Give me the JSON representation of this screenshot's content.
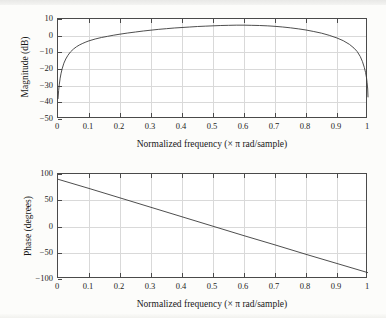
{
  "figure": {
    "background_color": "#fcfcfa",
    "axes_color": "#4a4a4a",
    "grid_color": "#d9d9d9",
    "curve_color": "#3a3a3a"
  },
  "panels": [
    {
      "id": "magnitude-panel",
      "ylabel": "Magnitude (dB)",
      "xlabel": "Normalized frequency (× π rad/sample)",
      "xticks": [
        "0",
        "0.1",
        "0.2",
        "0.3",
        "0.4",
        "0.5",
        "0.6",
        "0.7",
        "0.8",
        "0.9",
        "1"
      ],
      "yticks": [
        "10",
        "0",
        "−10",
        "−20",
        "−30",
        "−40",
        "−50"
      ]
    },
    {
      "id": "phase-panel",
      "ylabel": "Phase (degrees)",
      "xlabel": "Normalized frequency (× π rad/sample)",
      "xticks": [
        "0",
        "0.1",
        "0.2",
        "0.3",
        "0.4",
        "0.5",
        "0.6",
        "0.7",
        "0.8",
        "0.9",
        "1"
      ],
      "yticks": [
        "100",
        "50",
        "0",
        "−50",
        "−100"
      ]
    }
  ],
  "chart_data": [
    {
      "type": "line",
      "id": "magnitude-response",
      "title": "",
      "xlabel": "Normalized frequency (× π rad/sample)",
      "ylabel": "Magnitude (dB)",
      "xlim": [
        0,
        1
      ],
      "ylim": [
        -50,
        10
      ],
      "xticks": [
        0,
        0.1,
        0.2,
        0.3,
        0.4,
        0.5,
        0.6,
        0.7,
        0.8,
        0.9,
        1
      ],
      "yticks": [
        10,
        0,
        -10,
        -20,
        -30,
        -40,
        -50
      ],
      "grid": true,
      "legend": "none",
      "series": [
        {
          "name": "Magnitude",
          "x": [
            0.0,
            0.002,
            0.004,
            0.007,
            0.01,
            0.014,
            0.019,
            0.025,
            0.032,
            0.04,
            0.05,
            0.06,
            0.07,
            0.08,
            0.09,
            0.1,
            0.12,
            0.14,
            0.16,
            0.18,
            0.2,
            0.225,
            0.25,
            0.275,
            0.3,
            0.325,
            0.35,
            0.375,
            0.4,
            0.425,
            0.45,
            0.475,
            0.5,
            0.525,
            0.55,
            0.575,
            0.6,
            0.625,
            0.65,
            0.675,
            0.7,
            0.725,
            0.75,
            0.775,
            0.8,
            0.825,
            0.85,
            0.875,
            0.9,
            0.92,
            0.94,
            0.955,
            0.965,
            0.975,
            0.982,
            0.988,
            0.992,
            0.995,
            0.997,
            0.999,
            1.0
          ],
          "y": [
            -38.0,
            -33.0,
            -29.5,
            -25.5,
            -22.5,
            -19.5,
            -16.5,
            -14.0,
            -11.8,
            -9.8,
            -8.0,
            -6.6,
            -5.5,
            -4.6,
            -3.8,
            -3.1,
            -2.0,
            -1.1,
            -0.4,
            0.3,
            0.9,
            1.6,
            2.2,
            2.8,
            3.3,
            3.8,
            4.2,
            4.6,
            4.9,
            5.2,
            5.5,
            5.7,
            5.9,
            6.1,
            6.2,
            6.3,
            6.3,
            6.2,
            6.1,
            5.9,
            5.6,
            5.2,
            4.7,
            4.1,
            3.4,
            2.5,
            1.5,
            0.2,
            -1.4,
            -3.0,
            -5.2,
            -7.5,
            -9.5,
            -12.5,
            -15.5,
            -19.0,
            -22.0,
            -25.0,
            -28.0,
            -32.0,
            -37.0
          ]
        }
      ]
    },
    {
      "type": "line",
      "id": "phase-response",
      "title": "",
      "xlabel": "Normalized frequency (× π rad/sample)",
      "ylabel": "Phase (degrees)",
      "xlim": [
        0,
        1
      ],
      "ylim": [
        -100,
        100
      ],
      "xticks": [
        0,
        0.1,
        0.2,
        0.3,
        0.4,
        0.5,
        0.6,
        0.7,
        0.8,
        0.9,
        1
      ],
      "yticks": [
        100,
        50,
        0,
        -50,
        -100
      ],
      "grid": true,
      "legend": "none",
      "series": [
        {
          "name": "Phase",
          "x": [
            0.0,
            0.1,
            0.2,
            0.3,
            0.4,
            0.5,
            0.6,
            0.7,
            0.8,
            0.9,
            1.0
          ],
          "y": [
            90.0,
            72.5,
            54.5,
            36.5,
            18.5,
            0.5,
            -17.5,
            -35.0,
            -53.0,
            -70.5,
            -88.0
          ]
        }
      ]
    }
  ]
}
